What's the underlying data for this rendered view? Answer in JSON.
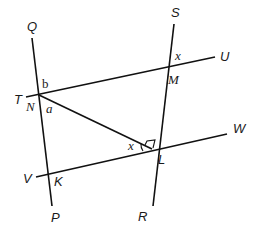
{
  "diagram": {
    "title": "",
    "lines": [
      {
        "name": "QP",
        "from": "Q",
        "to": "P",
        "x1": 32,
        "y1": 38,
        "x2": 52,
        "y2": 206
      },
      {
        "name": "SR",
        "from": "S",
        "to": "R",
        "x1": 174,
        "y1": 24,
        "x2": 153,
        "y2": 206
      },
      {
        "name": "TU",
        "from": "T",
        "to": "U",
        "x1": 26,
        "y1": 97,
        "x2": 215,
        "y2": 57
      },
      {
        "name": "VW",
        "from": "V",
        "to": "W",
        "x1": 36,
        "y1": 177,
        "x2": 227,
        "y2": 134
      },
      {
        "name": "NL",
        "from": "N",
        "to": "L",
        "x1": 39,
        "y1": 95,
        "x2": 152,
        "y2": 149
      }
    ],
    "point_labels": {
      "Q": "Q",
      "P": "P",
      "S": "S",
      "R": "R",
      "T": "T",
      "U": "U",
      "V": "V",
      "W": "W",
      "N": "N",
      "M": "M",
      "K": "K",
      "L": "L"
    },
    "angle_labels": {
      "b": "b",
      "a": "a",
      "x_at_M": "x",
      "x_at_L": "x"
    },
    "right_angle_at": "L",
    "colors": {
      "stroke": "#111111",
      "text": "#1a1a1a",
      "background": "#ffffff"
    }
  }
}
